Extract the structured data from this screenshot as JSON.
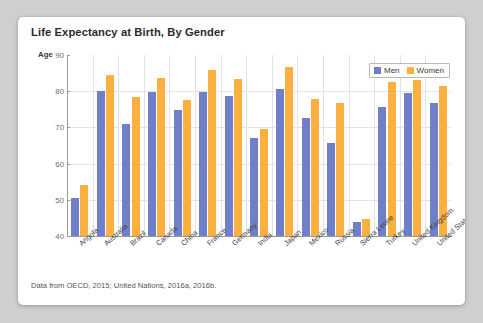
{
  "card": {
    "title": "Life Expectancy at Birth, By Gender",
    "footnote": "Data from OECD, 2015; United Nations, 2016a, 2016b."
  },
  "axis": {
    "y_label": "Age",
    "ticks": [
      "90",
      "80",
      "70",
      "60",
      "50",
      "40"
    ]
  },
  "legend": {
    "position": "top-right",
    "items": [
      {
        "label": "Men",
        "color": "#6f80c9"
      },
      {
        "label": "Women",
        "color": "#fbb03f"
      }
    ]
  },
  "chart_data": {
    "type": "bar",
    "title": "Life Expectancy at Birth, By Gender",
    "xlabel": "",
    "ylabel": "Age",
    "ylim": [
      40,
      90
    ],
    "yticks": [
      40,
      50,
      60,
      70,
      80,
      90
    ],
    "grid": true,
    "legend_position": "top-right",
    "categories": [
      "Angola",
      "Australia",
      "Brazil",
      "Canada",
      "China",
      "France",
      "Germany",
      "India",
      "Japan",
      "Mexico",
      "Russia",
      "Sierra Leone",
      "Turkey",
      "United Kingdom",
      "United States"
    ],
    "series": [
      {
        "name": "Men",
        "color": "#6f80c9",
        "values": [
          50.6,
          80.0,
          71.0,
          79.8,
          74.8,
          79.7,
          78.7,
          67.0,
          80.7,
          72.6,
          65.6,
          44.0,
          75.6,
          79.5,
          76.8
        ]
      },
      {
        "name": "Women",
        "color": "#fbb03f",
        "values": [
          54.0,
          84.5,
          78.3,
          83.6,
          77.5,
          85.8,
          83.5,
          69.5,
          86.8,
          77.8,
          76.8,
          44.6,
          82.5,
          83.2,
          81.5
        ]
      }
    ],
    "annotations": [
      "Data from OECD, 2015; United Nations, 2016a, 2016b."
    ]
  }
}
